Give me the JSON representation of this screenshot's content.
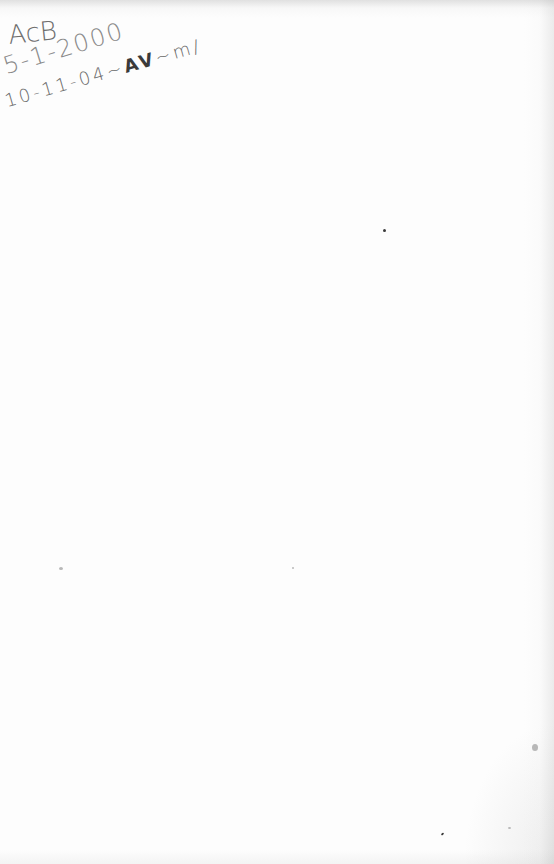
{
  "document": {
    "type": "scanned-page",
    "background_color": "#fdfdfd",
    "ink_color": "#6e6e6e",
    "annotations": [
      {
        "name": "initials",
        "text": "AcB"
      },
      {
        "name": "date-1",
        "text": "5-1-2000"
      },
      {
        "name": "date-2",
        "text_prefix": "10-11-04~",
        "text_dark": "AV",
        "text_suffix": "~m/"
      }
    ],
    "body_text": ""
  }
}
